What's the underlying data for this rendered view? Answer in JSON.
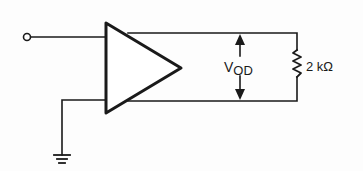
{
  "diagram": {
    "type": "circuit-schematic",
    "components": {
      "input_terminal": {
        "kind": "open-terminal"
      },
      "amplifier": {
        "kind": "differential-output-amplifier"
      },
      "load_resistor": {
        "kind": "resistor",
        "value": "2 kΩ"
      },
      "ground": {
        "kind": "ground"
      }
    },
    "labels": {
      "vod_main": "V",
      "vod_sub": "OD",
      "resistor_value": "2 kΩ"
    },
    "colors": {
      "line": "#1a1a1a",
      "background": "#fdfdfd"
    }
  }
}
